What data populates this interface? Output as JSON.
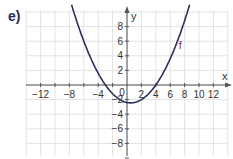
{
  "exercise_label": "e)",
  "colors": {
    "grid": "#e3e3e3",
    "axis": "#555555",
    "curve": "#2e2f5e",
    "function_label": "#8a2a6a"
  },
  "chart_data": {
    "type": "line",
    "title": "",
    "xlabel": "x",
    "ylabel": "y",
    "xlim": [
      -14,
      14
    ],
    "ylim": [
      -10,
      10
    ],
    "grid": true,
    "grid_step": 2,
    "x_ticks": [
      -12,
      -10,
      -8,
      -6,
      -4,
      -2,
      2,
      4,
      6,
      8,
      10,
      12
    ],
    "x_tick_labels": [
      "−12",
      "−8",
      "−4",
      "0",
      "2",
      "4",
      "6",
      "8",
      "10",
      "12"
    ],
    "y_tick_labels": [
      "8",
      "6",
      "4",
      "2",
      "−2",
      "−4",
      "−6",
      "−8"
    ],
    "origin_label": "0",
    "series": [
      {
        "name": "f",
        "description": "upward parabola, f(x) ≈ 0.2(x+3)(x−4), vertex ≈ (0.5, −2.45), roots ≈ −3 and 4",
        "x": [
          -7.6,
          -7,
          -6,
          -5,
          -4,
          -3,
          -2,
          -1,
          0,
          0.5,
          1,
          2,
          3,
          4,
          5,
          6,
          7,
          8,
          8.6
        ],
        "y": [
          10.6,
          9.2,
          7.2,
          5.4,
          3.2,
          0.0,
          -1.2,
          -2.0,
          -2.4,
          -2.45,
          -2.4,
          -2.0,
          -1.2,
          0.0,
          1.6,
          3.6,
          6.0,
          8.8,
          10.6
        ]
      }
    ],
    "annotations": [
      {
        "text": "f",
        "x": 7.2,
        "y": 5.0
      }
    ]
  }
}
